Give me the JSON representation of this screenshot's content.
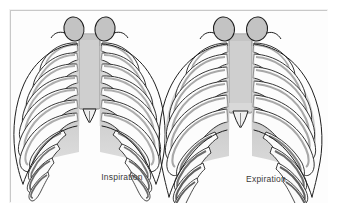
{
  "figure": {
    "type": "anatomical-diagram",
    "background_color": "#ffffff",
    "frame_color": "#c8c8c8",
    "panels": [
      {
        "id": "inspiration",
        "caption": "Inspiration",
        "description": "Anterior view of the thoracic cage during inspiration; ribs elevated, narrower transverse diameter, ribs more horizontal.",
        "structures": [
          "clavicle-left",
          "clavicle-right",
          "sternum",
          "xiphoid-process",
          "true-ribs",
          "false-ribs",
          "costal-cartilage",
          "costal-margin"
        ],
        "rib_pairs": 10
      },
      {
        "id": "expiration",
        "caption": "Expiration",
        "description": "Anterior view of the thoracic cage during expiration; ribs depressed and sloping downward, wider costal angle, sternum lower.",
        "structures": [
          "clavicle-left",
          "clavicle-right",
          "sternum",
          "xiphoid-process",
          "true-ribs",
          "false-ribs",
          "costal-cartilage",
          "costal-margin"
        ],
        "rib_pairs": 10
      }
    ],
    "colors": {
      "bone_fill": "#fefefe",
      "bone_shade": "#b8b8b8",
      "bone_shade_dark": "#8e8e8e",
      "bone_outline": "#1f1f1f",
      "sternum_fill": "#cfcfcf",
      "clavicle_fill": "#c2c2c2",
      "caption_text": "#3a3a3a"
    }
  }
}
